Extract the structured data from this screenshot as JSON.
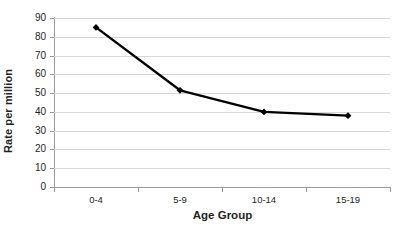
{
  "chart_data": {
    "type": "line",
    "title": "",
    "xlabel": "Age Group",
    "ylabel": "Rate per million",
    "categories": [
      "0-4",
      "5-9",
      "10-14",
      "15-19"
    ],
    "values": [
      85,
      51.5,
      40,
      38
    ],
    "series": [
      {
        "name": "Rate per million",
        "values": [
          85,
          51.5,
          40,
          38
        ],
        "color": "#000000",
        "marker": "diamond"
      }
    ],
    "ylim": [
      0,
      90
    ],
    "ytick_labels": [
      "0",
      "10",
      "20",
      "30",
      "40",
      "50",
      "60",
      "70",
      "80",
      "90"
    ],
    "ytick_values": [
      0,
      10,
      20,
      30,
      40,
      50,
      60,
      70,
      80,
      90
    ],
    "xlim_categories": 4,
    "grid": {
      "horizontal": true,
      "vertical": false,
      "color": "#d8d8d8"
    },
    "legend": {
      "visible": false,
      "position": "none"
    },
    "axis_color": "#9a9a9a",
    "background": "#ffffff"
  }
}
